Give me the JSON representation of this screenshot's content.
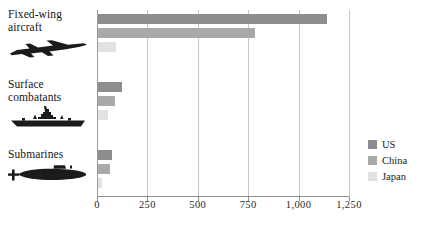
{
  "chart_data": {
    "type": "bar",
    "orientation": "horizontal",
    "title": "",
    "xlabel": "",
    "ylabel": "",
    "categories": [
      "Fixed-wing aircraft",
      "Surface combatants",
      "Submarines"
    ],
    "series": [
      {
        "name": "US",
        "color": "#8d8d8d",
        "values": [
          1135,
          120,
          70
        ]
      },
      {
        "name": "China",
        "color": "#a9a9a9",
        "values": [
          780,
          85,
          60
        ]
      },
      {
        "name": "Japan",
        "color": "#e2e2e2",
        "values": [
          90,
          50,
          20
        ]
      }
    ],
    "xlim": [
      0,
      1250
    ],
    "xticks": [
      0,
      250,
      500,
      750,
      1000,
      1250
    ],
    "xtick_labels": [
      "0",
      "250",
      "500",
      "750",
      "1,000",
      "1,250"
    ],
    "grid": true,
    "grid_axis": "x",
    "legend_position": "right"
  },
  "categories": [
    {
      "label": "Fixed-wing\naircraft",
      "icon": "fighter-jet-icon"
    },
    {
      "label": "Surface\ncombatants",
      "icon": "warship-icon"
    },
    {
      "label": "Submarines",
      "icon": "submarine-icon"
    }
  ],
  "legend": {
    "items": [
      {
        "label": "US",
        "color": "#8d8d8d"
      },
      {
        "label": "China",
        "color": "#a9a9a9"
      },
      {
        "label": "Japan",
        "color": "#e2e2e2"
      }
    ]
  }
}
